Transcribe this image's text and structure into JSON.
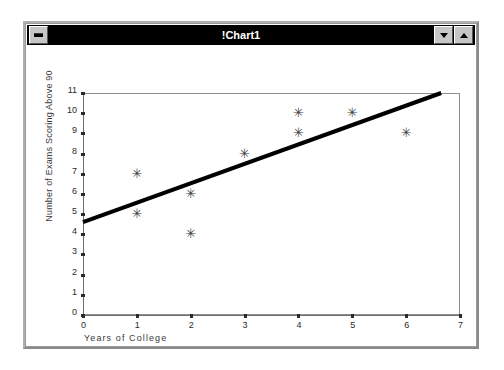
{
  "window": {
    "title": "!Chart1",
    "sys_menu_icon": "window-menu-icon",
    "minimize_icon": "chevron-down-icon",
    "maximize_icon": "chevron-up-icon",
    "titlebar_bg": "#000000",
    "titlebar_fg": "#ffffff",
    "frame_bg": "#c6c6c6"
  },
  "chart_data": {
    "type": "scatter",
    "title": "",
    "xlabel": "Years of College",
    "ylabel": "Number of Exams Scoring Above 90",
    "xlim": [
      0,
      7
    ],
    "ylim": [
      0,
      11
    ],
    "xticks": [
      0,
      1,
      2,
      3,
      4,
      5,
      6,
      7
    ],
    "yticks": [
      0,
      1,
      2,
      3,
      4,
      5,
      6,
      7,
      8,
      9,
      10,
      11
    ],
    "grid": false,
    "legend": "none",
    "marker": "asterisk",
    "marker_glyph": "✳",
    "marker_color": "#3c3c3c",
    "points": [
      {
        "x": 1,
        "y": 7
      },
      {
        "x": 1,
        "y": 5
      },
      {
        "x": 2,
        "y": 6
      },
      {
        "x": 2,
        "y": 4
      },
      {
        "x": 3,
        "y": 8
      },
      {
        "x": 4,
        "y": 10
      },
      {
        "x": 4,
        "y": 9
      },
      {
        "x": 5,
        "y": 10
      },
      {
        "x": 6,
        "y": 9
      }
    ],
    "series": [
      {
        "name": "Exams above 90",
        "type": "scatter",
        "x": [
          1,
          1,
          2,
          2,
          3,
          4,
          4,
          5,
          6
        ],
        "values": [
          7,
          5,
          6,
          4,
          8,
          10,
          9,
          10,
          9
        ]
      },
      {
        "name": "Trend line",
        "type": "line",
        "x": [
          0,
          6.65
        ],
        "values": [
          4.6,
          11.0
        ],
        "color": "#000000",
        "width": 4
      }
    ],
    "trend_line": {
      "x_start": 0,
      "y_start": 4.6,
      "x_end": 6.65,
      "y_end": 11.0,
      "color": "#000000",
      "thickness": 4
    }
  }
}
